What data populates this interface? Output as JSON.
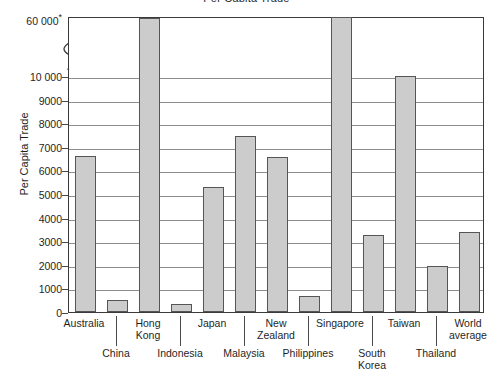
{
  "chart_data": {
    "type": "bar",
    "title": "Per Capita Trade",
    "xlabel": "",
    "ylabel": "Per Capita Trade",
    "ylim": [
      0,
      60000
    ],
    "grid": true,
    "legend": false,
    "axis_break": true,
    "axis_break_note": "Y axis is broken between 10 000 and 60 000",
    "ytick_labels": [
      "60 000*",
      "10 000",
      "9000",
      "8000",
      "7000",
      "6000",
      "5000",
      "4000",
      "3000",
      "2000",
      "1000",
      "0"
    ],
    "ytick_values": [
      60000,
      10000,
      9000,
      8000,
      7000,
      6000,
      5000,
      4000,
      3000,
      2000,
      1000,
      0
    ],
    "footnote_marker": "*",
    "categories": [
      "Australia",
      "China",
      "Hong Kong",
      "Indonesia",
      "Japan",
      "Malaysia",
      "New Zealand",
      "Philippines",
      "Singapore",
      "South Korea",
      "Taiwan",
      "Thailand",
      "World average"
    ],
    "values": [
      6600,
      500,
      58500,
      350,
      5300,
      7450,
      6550,
      680,
      59500,
      3250,
      10000,
      1950,
      3400
    ],
    "series": [
      {
        "name": "Per Capita Trade",
        "values": [
          6600,
          500,
          58500,
          350,
          5300,
          7450,
          6550,
          680,
          59500,
          3250,
          10000,
          1950,
          3400
        ]
      }
    ],
    "bar_fill": "#cccccc",
    "bar_stroke": "#555555"
  },
  "axis": {
    "y_title": "Per Capita Trade"
  },
  "labels": {
    "australia": "Australia",
    "china": "China",
    "hong_kong": "Hong\nKong",
    "indonesia": "Indonesia",
    "japan": "Japan",
    "malaysia": "Malaysia",
    "new_zealand": "New\nZealand",
    "philippines": "Philippines",
    "singapore": "Singapore",
    "south_korea": "South\nKorea",
    "taiwan": "Taiwan",
    "thailand": "Thailand",
    "world_average": "World\naverage"
  },
  "yticks": {
    "t60000": "60 000*",
    "t10000": "10 000",
    "t9000": "9000",
    "t8000": "8000",
    "t7000": "7000",
    "t6000": "6000",
    "t5000": "5000",
    "t4000": "4000",
    "t3000": "3000",
    "t2000": "2000",
    "t1000": "1000",
    "t0": "0"
  }
}
